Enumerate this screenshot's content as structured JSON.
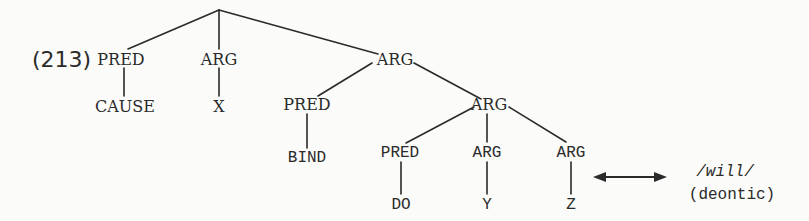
{
  "example_label": "(213)",
  "tree": {
    "nodes": {
      "pred_cause": "PRED",
      "cause": "CAUSE",
      "arg_x": "ARG",
      "x": "X",
      "arg_top": "ARG",
      "pred_bind": "PRED",
      "bind": "BIND",
      "arg_mid": "ARG",
      "pred_do": "PRED",
      "do": "DO",
      "arg_y": "ARG",
      "y": "Y",
      "arg_z": "ARG",
      "z": "Z"
    }
  },
  "annotation": {
    "arrow": "bidirectional-arrow",
    "form": "/will/",
    "gloss": "(deontic)"
  },
  "colors": {
    "ink": "#2a2a2a",
    "background": "#fbfbf9"
  }
}
